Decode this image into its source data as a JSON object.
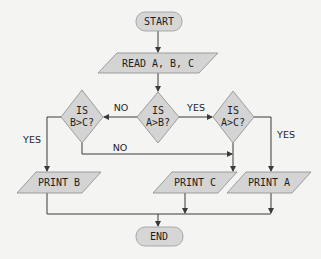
{
  "diagram": {
    "type": "flowchart",
    "title": "",
    "nodes": {
      "start": {
        "shape": "terminal",
        "label": "START"
      },
      "read": {
        "shape": "parallelogram",
        "label": "READ A, B, C"
      },
      "dec_ab": {
        "shape": "diamond",
        "line1": "IS",
        "line2": "A>B?"
      },
      "dec_bc": {
        "shape": "diamond",
        "line1": "IS",
        "line2": "B>C?"
      },
      "dec_ac": {
        "shape": "diamond",
        "line1": "IS",
        "line2": "A>C?"
      },
      "print_b": {
        "shape": "parallelogram",
        "label": "PRINT B"
      },
      "print_c": {
        "shape": "parallelogram",
        "label": "PRINT C"
      },
      "print_a": {
        "shape": "parallelogram",
        "label": "PRINT A"
      },
      "end": {
        "shape": "terminal",
        "label": "END"
      }
    },
    "edges": [
      {
        "from": "start",
        "to": "read",
        "label": ""
      },
      {
        "from": "read",
        "to": "dec_ab",
        "label": ""
      },
      {
        "from": "dec_ab",
        "to": "dec_bc",
        "label": "NO"
      },
      {
        "from": "dec_ab",
        "to": "dec_ac",
        "label": "YES"
      },
      {
        "from": "dec_bc",
        "to": "print_b",
        "label": "YES"
      },
      {
        "from": "dec_bc",
        "to": "print_c",
        "label": "NO"
      },
      {
        "from": "dec_ac",
        "to": "print_a",
        "label": "YES"
      },
      {
        "from": "dec_ac",
        "to": "print_c",
        "label": ""
      },
      {
        "from": "print_b",
        "to": "end",
        "label": ""
      },
      {
        "from": "print_c",
        "to": "end",
        "label": ""
      },
      {
        "from": "print_a",
        "to": "end",
        "label": ""
      }
    ],
    "edge_labels": {
      "ab_no": "NO",
      "ab_yes": "YES",
      "bc_yes": "YES",
      "bc_no": "NO",
      "ac_yes": "YES"
    },
    "colors": {
      "shape_fill": "#d4d4d4",
      "line": "#3a3a3a",
      "text": "#1e1e1e",
      "background": "#f4f4f2"
    }
  }
}
